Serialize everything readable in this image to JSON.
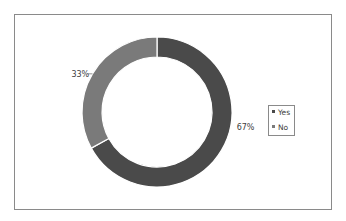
{
  "chart_data": {
    "type": "pie",
    "variant": "donut",
    "title": "",
    "categories": [
      "Yes",
      "No"
    ],
    "values": [
      67,
      33
    ],
    "unit": "%",
    "data_labels": [
      "67%",
      "33%"
    ],
    "colors": [
      "#4a4a4a",
      "#7a7a7a"
    ],
    "legend": {
      "position": "right",
      "entries": [
        {
          "label": "Yes",
          "color": "#4a4a4a"
        },
        {
          "label": "No",
          "color": "#7a7a7a"
        }
      ]
    },
    "start_angle": "12 o'clock",
    "direction": "clockwise"
  }
}
